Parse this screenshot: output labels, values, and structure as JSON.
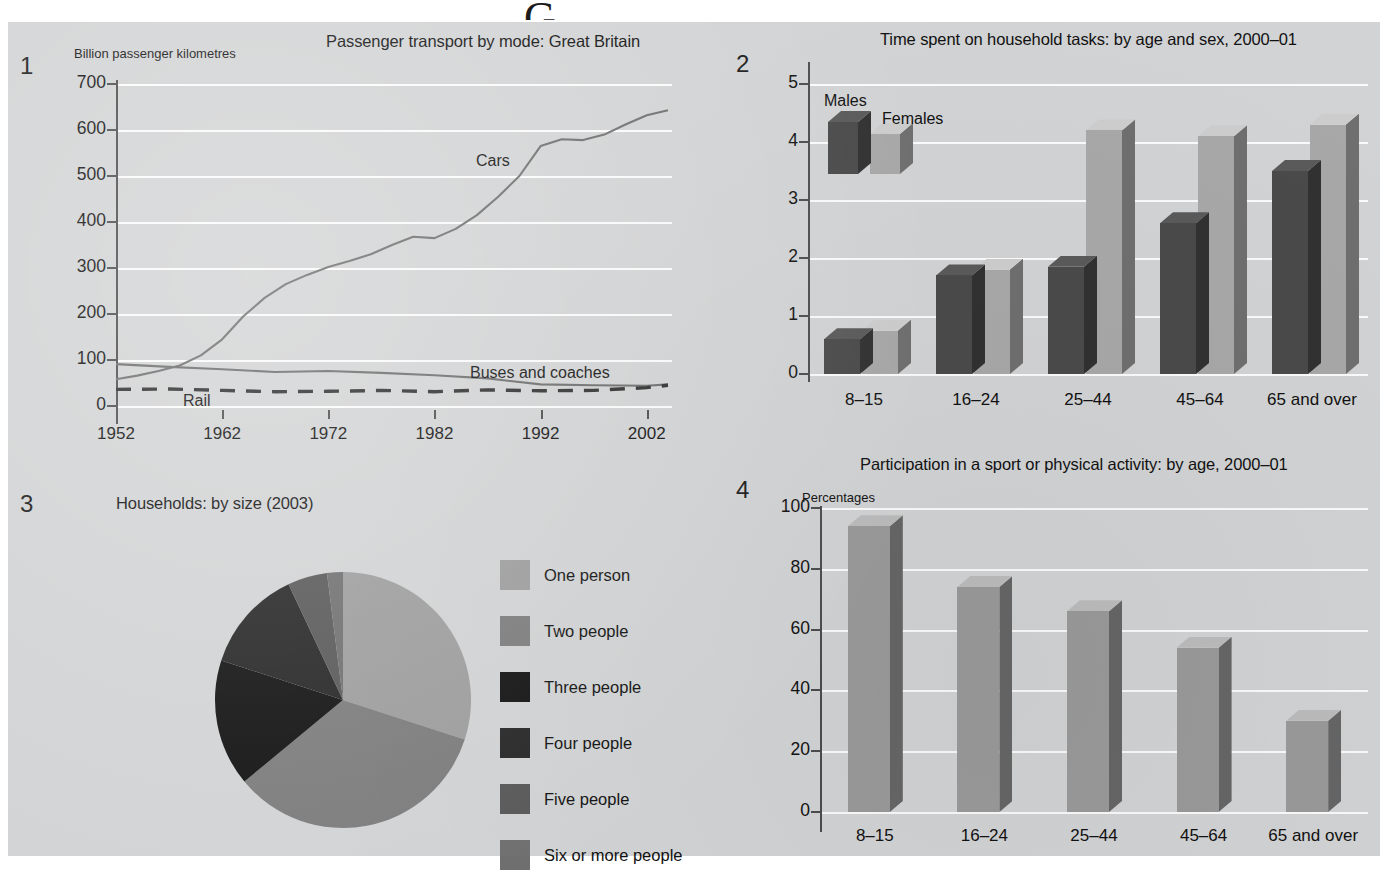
{
  "page": {
    "cut_off_heading_fragment": "G",
    "background": "#d2d3d4",
    "gridline_color": "#fbfbfb",
    "axis_color": "#4c4c4c"
  },
  "panels": [
    {
      "number": "1",
      "title": "Passenger transport by mode: Great Britain",
      "chart_data": {
        "type": "line",
        "title": "Passenger transport by mode: Great Britain",
        "ylabel": "Billion passenger kilometres",
        "xlabel": "",
        "ylim": [
          0,
          700
        ],
        "yticks": [
          0,
          100,
          200,
          300,
          400,
          500,
          600,
          700
        ],
        "xlim": [
          1952,
          2004
        ],
        "xticks": [
          1952,
          1962,
          1972,
          1982,
          1992,
          2002
        ],
        "grid": true,
        "legend_position": "inline-annotations",
        "series": [
          {
            "name": "Cars",
            "style": "solid",
            "color": "#6e6e6e",
            "x": [
              1952,
              1954,
              1956,
              1958,
              1960,
              1962,
              1964,
              1966,
              1968,
              1970,
              1972,
              1974,
              1976,
              1978,
              1980,
              1982,
              1984,
              1986,
              1988,
              1990,
              1992,
              1994,
              1996,
              1998,
              2000,
              2002,
              2004
            ],
            "values": [
              58,
              66,
              76,
              88,
              110,
              145,
              195,
              235,
              265,
              285,
              302,
              315,
              330,
              350,
              368,
              365,
              385,
              415,
              455,
              500,
              565,
              580,
              578,
              590,
              612,
              632,
              643
            ]
          },
          {
            "name": "Buses and coaches",
            "style": "solid",
            "color": "#6b6b6b",
            "x": [
              1952,
              1957,
              1962,
              1967,
              1972,
              1977,
              1982,
              1987,
              1992,
              1997,
              2002,
              2004
            ],
            "values": [
              91,
              85,
              80,
              74,
              76,
              72,
              67,
              60,
              47,
              45,
              44,
              47
            ]
          },
          {
            "name": "Rail",
            "style": "dashed",
            "color": "#2d2d2d",
            "x": [
              1952,
              1957,
              1962,
              1967,
              1972,
              1977,
              1982,
              1987,
              1992,
              1997,
              2002,
              2004
            ],
            "values": [
              36,
              37,
              34,
              31,
              32,
              34,
              31,
              35,
              33,
              34,
              40,
              45
            ]
          }
        ]
      }
    },
    {
      "number": "2",
      "title": "Time spent on household tasks: by age and sex, 2000–01",
      "chart_data": {
        "type": "bar",
        "title": "Time spent on household tasks: by age and sex, 2000–01",
        "ylabel": "",
        "xlabel": "",
        "ylim": [
          0,
          5
        ],
        "yticks": [
          0,
          1,
          2,
          3,
          4,
          5
        ],
        "grid": true,
        "style": "3d-grouped",
        "legend_position": "top-left",
        "categories": [
          "8–15",
          "16–24",
          "25–44",
          "45–64",
          "65 and over"
        ],
        "series": [
          {
            "name": "Males",
            "color": "#4a4a4a",
            "values": [
              0.6,
              1.7,
              1.85,
              2.6,
              3.5
            ]
          },
          {
            "name": "Females",
            "color": "#a8a8a8",
            "values": [
              0.75,
              1.8,
              4.2,
              4.1,
              4.3
            ]
          }
        ]
      }
    },
    {
      "number": "3",
      "title": "Households: by size (2003)",
      "chart_data": {
        "type": "pie",
        "title": "Households: by size (2003)",
        "legend_position": "right",
        "start_angle_deg": 0,
        "labels": [
          "One person",
          "Two people",
          "Three people",
          "Four people",
          "Five people",
          "Six or more people"
        ],
        "values": [
          30,
          34,
          16,
          13,
          5,
          2
        ],
        "colors": [
          "#9d9d9d",
          "#7c7c7c",
          "#121212",
          "#262626",
          "#585858",
          "#6f6f6f"
        ]
      }
    },
    {
      "number": "4",
      "title": "Participation in a sport or physical activity: by age, 2000–01",
      "chart_data": {
        "type": "bar",
        "title": "Participation in a sport or physical activity: by age, 2000–01",
        "ylabel": "Percentages",
        "xlabel": "",
        "ylim": [
          0,
          100
        ],
        "yticks": [
          0,
          20,
          40,
          60,
          80,
          100
        ],
        "grid": true,
        "style": "3d-single",
        "categories": [
          "8–15",
          "16–24",
          "25–44",
          "45–64",
          "65 and over"
        ],
        "series": [
          {
            "name": "Participation",
            "color": "#9a9a9a",
            "values": [
              94,
              74,
              66,
              54,
              30
            ]
          }
        ]
      }
    }
  ]
}
